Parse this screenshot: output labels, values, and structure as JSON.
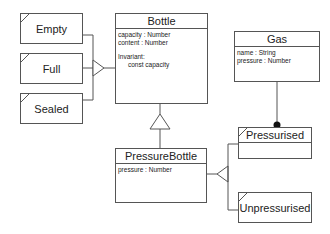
{
  "diagram": {
    "type": "UML class diagram",
    "classes": {
      "bottle": {
        "name": "Bottle",
        "attributes": [
          "capacity : Number",
          "content : Number"
        ],
        "invariant_label": "Invariant:",
        "invariant_expr": "const capacity"
      },
      "pressure_bottle": {
        "name": "PressureBottle",
        "attributes": [
          "pressure : Number"
        ]
      },
      "gas": {
        "name": "Gas",
        "attributes": [
          "name : String",
          "pressure : Number"
        ]
      }
    },
    "states": {
      "empty": "Empty",
      "full": "Full",
      "sealed": "Sealed",
      "pressurised": "Pressurised",
      "unpressurised": "Unpressurised"
    },
    "relationships": [
      {
        "from": "Empty",
        "to": "Bottle",
        "kind": "state-group"
      },
      {
        "from": "Full",
        "to": "Bottle",
        "kind": "state-group"
      },
      {
        "from": "Sealed",
        "to": "Bottle",
        "kind": "state-group"
      },
      {
        "from": "PressureBottle",
        "to": "Bottle",
        "kind": "generalization"
      },
      {
        "from": "Pressurised",
        "to": "PressureBottle",
        "kind": "state-group"
      },
      {
        "from": "Unpressurised",
        "to": "PressureBottle",
        "kind": "state-group"
      },
      {
        "from": "Gas",
        "to": "Pressurised",
        "kind": "association-filled-dot"
      }
    ],
    "colors": {
      "line": "#555555",
      "background": "#ffffff",
      "text": "#222222"
    }
  }
}
